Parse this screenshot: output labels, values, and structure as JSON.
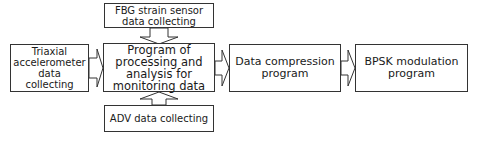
{
  "diagram": {
    "nodes": {
      "fbg": {
        "label": "FBG strain sensor data collecting"
      },
      "triaxial": {
        "label": "Triaxial accelerometer data collecting"
      },
      "main": {
        "label": "Program of processing and analysis for monitoring data"
      },
      "adv": {
        "label": "ADV data collecting"
      },
      "compression": {
        "label": "Data compression program"
      },
      "bpsk": {
        "label": "BPSK modulation program"
      }
    },
    "edges": [
      {
        "from": "fbg",
        "to": "main",
        "direction": "down"
      },
      {
        "from": "triaxial",
        "to": "main",
        "direction": "right"
      },
      {
        "from": "adv",
        "to": "main",
        "direction": "up"
      },
      {
        "from": "main",
        "to": "compression",
        "direction": "right"
      },
      {
        "from": "compression",
        "to": "bpsk",
        "direction": "right"
      }
    ],
    "colors": {
      "stroke": "#333333",
      "fill": "#ffffff",
      "text": "#1a1a1a"
    }
  }
}
